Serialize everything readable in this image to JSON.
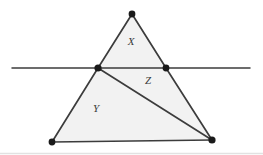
{
  "figure": {
    "type": "geometry-diagram",
    "canvas": {
      "width": 263,
      "height": 155
    },
    "colors": {
      "background": "#ffffff",
      "region_fill": "#f2f2f2",
      "stroke": "#3c3c3c",
      "vertex_dot": "#1a1a1a",
      "label_text": "#3a3a3a",
      "frame": "#e2e2e2"
    },
    "stroke_width": 1.6,
    "dot_radius": 3.4,
    "points": {
      "apex": {
        "name": "apex",
        "x": 132,
        "y": 14,
        "marked": true
      },
      "left_cross": {
        "name": "left-intersection",
        "x": 98,
        "y": 68,
        "marked": true
      },
      "right_cross": {
        "name": "right-intersection",
        "x": 166,
        "y": 68,
        "marked": true
      },
      "bottom_left": {
        "name": "bottom-left",
        "x": 52,
        "y": 142,
        "marked": true
      },
      "bottom_right": {
        "name": "bottom-right",
        "x": 212,
        "y": 140,
        "marked": true
      }
    },
    "secant_line": {
      "name": "horizontal-line",
      "x1": 12,
      "y1": 68,
      "x2": 250,
      "y2": 68
    },
    "regions": [
      {
        "id": "X",
        "label": "X",
        "label_x": 131,
        "label_y": 42,
        "vertices": "132,14 166,68 98,68",
        "description": "upper triangle above the horizontal line"
      },
      {
        "id": "Z",
        "label": "Z",
        "label_x": 148,
        "label_y": 81,
        "vertices": "98,68 166,68 212,140",
        "description": "middle-right triangle between horizontal line and diagonal"
      },
      {
        "id": "Y",
        "label": "Y",
        "label_x": 96,
        "label_y": 109,
        "vertices": "98,68 212,140 52,142",
        "description": "lower-left triangle below the diagonal"
      }
    ],
    "edges": [
      {
        "name": "left-side-upper",
        "x1": 132,
        "y1": 14,
        "x2": 98,
        "y2": 68
      },
      {
        "name": "right-side-upper",
        "x1": 132,
        "y1": 14,
        "x2": 166,
        "y2": 68
      },
      {
        "name": "left-side-lower",
        "x1": 98,
        "y1": 68,
        "x2": 52,
        "y2": 142
      },
      {
        "name": "right-side-lower",
        "x1": 166,
        "y1": 68,
        "x2": 212,
        "y2": 140
      },
      {
        "name": "base",
        "x1": 52,
        "y1": 142,
        "x2": 212,
        "y2": 140
      },
      {
        "name": "diagonal-cevian",
        "x1": 98,
        "y1": 68,
        "x2": 212,
        "y2": 140
      }
    ]
  }
}
